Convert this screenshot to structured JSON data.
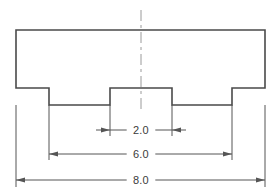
{
  "drawing": {
    "title": "Slotted Block Front View",
    "view_label": "front-view",
    "background_color": "#ffffff",
    "outline_color": "#4a4a4a",
    "dimension_color": "#555555",
    "text_color": "#3a3a3a",
    "centerline_color": "#9a9a9a",
    "outline_width": 1.6,
    "dimension_width": 1,
    "part": {
      "name": "slotted-block-profile",
      "left": 16,
      "right": 265,
      "top": 30,
      "shoulder_y": 88,
      "notch_bottom_y": 105,
      "left_notch_x": 49,
      "boss_left_x": 110,
      "boss_right_x": 172,
      "right_notch_x": 232,
      "path": "M 16 30 L 265 30 L 265 88 L 232 88 L 232 105 L 172 105 L 172 88 L 110 88 L 110 105 L 49 105 L 49 88 L 16 88 Z"
    },
    "centerline": {
      "name": "vertical-centerline",
      "x": 141,
      "y_top": 10,
      "y_bottom": 110,
      "dash_pattern": "11 4 3 4"
    },
    "dimensions": [
      {
        "id": "dim-2-0",
        "label": "2.0",
        "value": 2.0,
        "arrow_style": "inward",
        "line_y": 130,
        "x_start": 110,
        "x_end": 172,
        "ext_top_y": 105,
        "ext_bottom_y": 136,
        "text_x": 141,
        "text_y": 134
      },
      {
        "id": "dim-6-0",
        "label": "6.0",
        "value": 6.0,
        "arrow_style": "outward",
        "line_y": 154,
        "x_start": 49,
        "x_end": 232,
        "ext_top_y": 105,
        "ext_bottom_y": 160,
        "text_x": 141,
        "text_y": 158
      },
      {
        "id": "dim-8-0",
        "label": "8.0",
        "value": 8.0,
        "arrow_style": "outward",
        "line_y": 180,
        "x_start": 16,
        "x_end": 265,
        "ext_top_y": 105,
        "ext_bottom_y": 187,
        "text_x": 141,
        "text_y": 184
      }
    ]
  }
}
